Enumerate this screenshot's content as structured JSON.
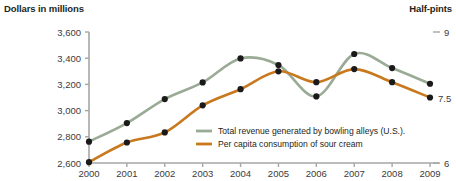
{
  "chart_data": {
    "type": "line",
    "title": "",
    "xlabel": "",
    "ylabel": "Dollars in millions",
    "y2label": "Half-pints",
    "x": [
      2000,
      2001,
      2002,
      2003,
      2004,
      2005,
      2006,
      2007,
      2008,
      2009
    ],
    "categories": [
      "2000",
      "2001",
      "2002",
      "2003",
      "2004",
      "2005",
      "2006",
      "2007",
      "2008",
      "2009"
    ],
    "ylim": [
      2600,
      3600
    ],
    "y2lim": [
      6,
      9
    ],
    "yticks": [
      2600,
      2800,
      3000,
      3200,
      3400,
      3600
    ],
    "ytick_labels": [
      "2,600",
      "2,800",
      "3,000",
      "3,200",
      "3,400",
      "3,600"
    ],
    "y2ticks": [
      6,
      9
    ],
    "y2tick_labels": [
      "6",
      "9"
    ],
    "grid": false,
    "legend_position": "inside-lower-right",
    "annotations": [
      {
        "text": "7.5",
        "series": "Per capita consumption of sour cream",
        "x": 2009
      }
    ],
    "series": [
      {
        "name": "Total revenue generated by bowling alleys (U.S.).",
        "color": "#9aab95",
        "axis": "left",
        "values": [
          2763,
          2905,
          3088,
          3215,
          3398,
          3348,
          3108,
          3432,
          3325,
          3205
        ]
      },
      {
        "name": "Per capita consumption of sour cream",
        "color": "#c8791e",
        "axis": "right",
        "values": [
          6.02,
          6.47,
          6.7,
          7.32,
          7.69,
          8.1,
          7.85,
          8.15,
          7.85,
          7.5
        ]
      }
    ]
  },
  "axes": {
    "left_title": "Dollars in millions",
    "right_title": "Half-pints",
    "right_top_tick": "9",
    "right_bottom_tick": "6"
  },
  "legend": {
    "items": [
      {
        "label": "Total revenue generated by bowling alleys (U.S.).",
        "color": "#9aab95"
      },
      {
        "label": "Per capita consumption of sour cream",
        "color": "#c8791e"
      }
    ]
  },
  "colors": {
    "series_green": "#9aab95",
    "series_orange": "#c8791e",
    "axis": "#a6a6a6",
    "marker": "#1a1a1a",
    "text": "#231f20"
  }
}
